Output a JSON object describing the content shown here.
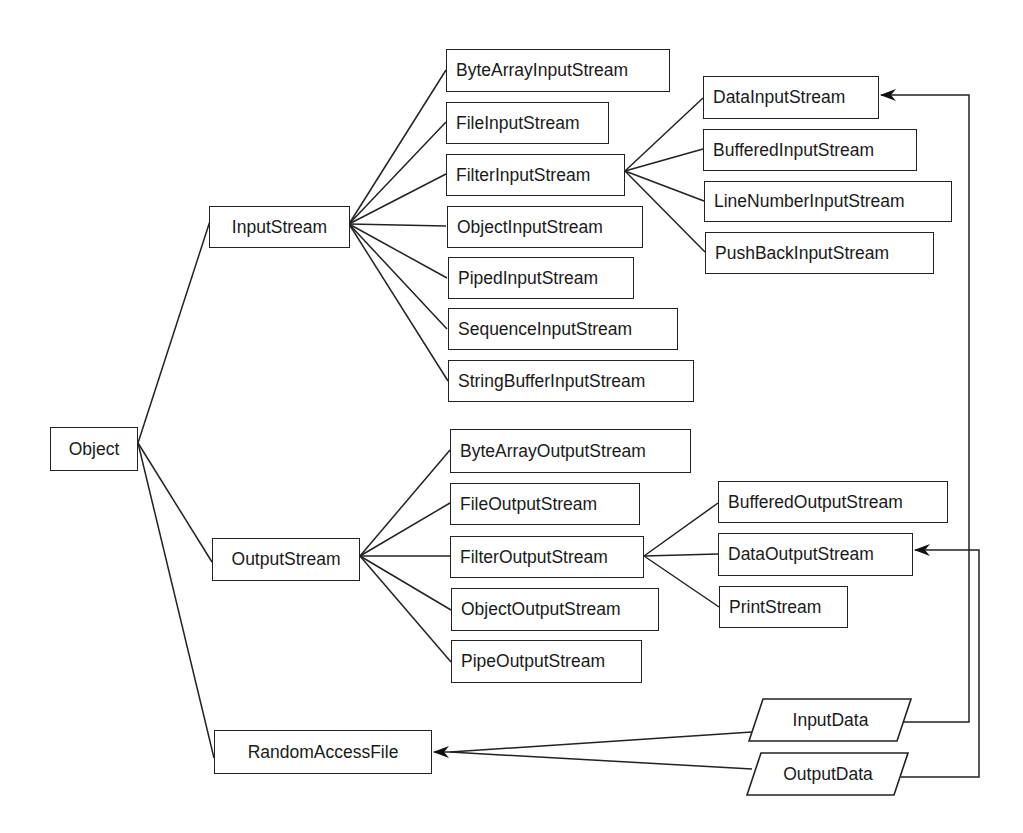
{
  "diagram": {
    "root": "Object",
    "level1": [
      "InputStream",
      "OutputStream",
      "RandomAccessFile"
    ],
    "input_streams": [
      "ByteArrayInputStream",
      "FileInputStream",
      "FilterInputStream",
      "ObjectInputStream",
      "PipedInputStream",
      "SequenceInputStream",
      "StringBufferInputStream"
    ],
    "filter_input_streams": [
      "DataInputStream",
      "BufferedInputStream",
      "LineNumberInputStream",
      "PushBackInputStream"
    ],
    "output_streams": [
      "ByteArrayOutputStream",
      "FileOutputStream",
      "FilterOutputStream",
      "ObjectOutputStream",
      "PipeOutputStream"
    ],
    "filter_output_streams": [
      "BufferedOutputStream",
      "DataOutputStream",
      "PrintStream"
    ],
    "interfaces": [
      "InputData",
      "OutputData"
    ],
    "implements_edges": [
      {
        "from": "InputData",
        "to": "DataInputStream"
      },
      {
        "from": "OutputData",
        "to": "DataOutputStream"
      },
      {
        "from": "InputData",
        "to": "RandomAccessFile"
      },
      {
        "from": "OutputData",
        "to": "RandomAccessFile"
      }
    ],
    "colors": {
      "stroke": "#222222",
      "background": "#ffffff",
      "text": "#1a1a1a"
    }
  }
}
